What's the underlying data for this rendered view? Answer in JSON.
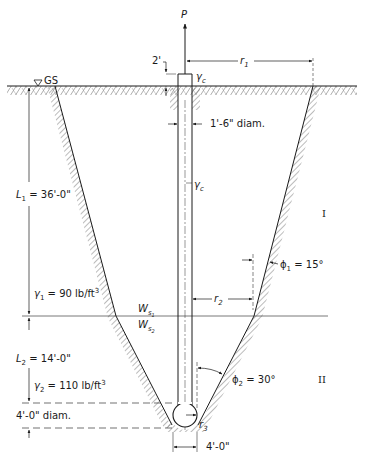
{
  "diagram": {
    "type": "drilled-pier-bell-pullout-cone",
    "labels": {
      "load": "P",
      "projection": "2'",
      "ground_surface": "GS",
      "r1": "r",
      "r1_sub": "1",
      "gamma_c_top": "γ",
      "gamma_c_top_sub": "c",
      "shaft_diam": "1'-6\" diam.",
      "gamma_c_shaft": "γ",
      "gamma_c_shaft_sub": "c",
      "L1": "L",
      "L1_sub": "1",
      "L1_value": " = 36'-0\"",
      "layer1": "I",
      "phi1": "ϕ",
      "phi1_sub": "1",
      "phi1_value": " = 15°",
      "gamma1": "γ",
      "gamma1_sub": "1",
      "gamma1_value": " = 90 lb/ft",
      "gamma1_exp": "3",
      "ws1": "W",
      "ws1_sub": "s",
      "ws1_subsub": "1",
      "r2": "r",
      "r2_sub": "2",
      "ws2": "W",
      "ws2_sub": "s",
      "ws2_subsub": "2",
      "L2": "L",
      "L2_sub": "2",
      "L2_value": " = 14'-0\"",
      "gamma2": "γ",
      "gamma2_sub": "2",
      "gamma2_value": " = 110 lb/ft",
      "gamma2_exp": "3",
      "phi2": "ϕ",
      "phi2_sub": "2",
      "phi2_value": " = 30°",
      "layer2": "II",
      "bell_diam": "4'-0\" diam.",
      "r3": "r",
      "r3_sub": "3",
      "base_width": "4'-0\""
    },
    "colors": {
      "line": "#1a1a1a",
      "hatch": "#555555",
      "background": "#ffffff"
    }
  }
}
